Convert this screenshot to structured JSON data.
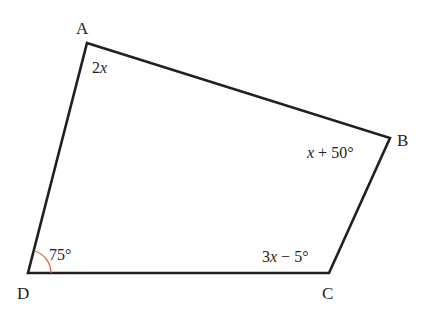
{
  "figure": {
    "type": "quadrilateral",
    "colors": {
      "edge": "#231f20",
      "arc": "#e0694a",
      "background": "#ffffff"
    },
    "vertices": [
      {
        "name": "A",
        "x": 87,
        "y": 43,
        "label_x": 76,
        "label_y": 34
      },
      {
        "name": "B",
        "x": 390,
        "y": 138,
        "label_x": 397,
        "label_y": 146
      },
      {
        "name": "C",
        "x": 329,
        "y": 273,
        "label_x": 322,
        "label_y": 299
      },
      {
        "name": "D",
        "x": 28,
        "y": 273,
        "label_x": 17,
        "label_y": 299
      }
    ],
    "angles": [
      {
        "vertex": "A",
        "var": "2x",
        "text_parts": [
          "2",
          "x",
          ""
        ],
        "x": 92,
        "y": 73
      },
      {
        "vertex": "B",
        "var": "x + 50°",
        "text_parts": [
          "",
          "x",
          " + 50°"
        ],
        "x": 307,
        "y": 158
      },
      {
        "vertex": "C",
        "var": "3x − 5°",
        "text_parts": [
          "3",
          "x",
          " − 5°"
        ],
        "x": 262,
        "y": 262
      },
      {
        "vertex": "D",
        "var": "75°",
        "text_parts": [
          "75°",
          "",
          ""
        ],
        "x": 49,
        "y": 260
      }
    ],
    "labels": {
      "A": "A",
      "B": "B",
      "C": "C",
      "D": "D",
      "angle_A_pre": "2",
      "angle_A_var": "x",
      "angle_A_post": "",
      "angle_B_pre": "",
      "angle_B_var": "x",
      "angle_B_post": " + 50°",
      "angle_C_pre": "3",
      "angle_C_var": "x",
      "angle_C_post": " − 5°",
      "angle_D": "75°"
    }
  }
}
